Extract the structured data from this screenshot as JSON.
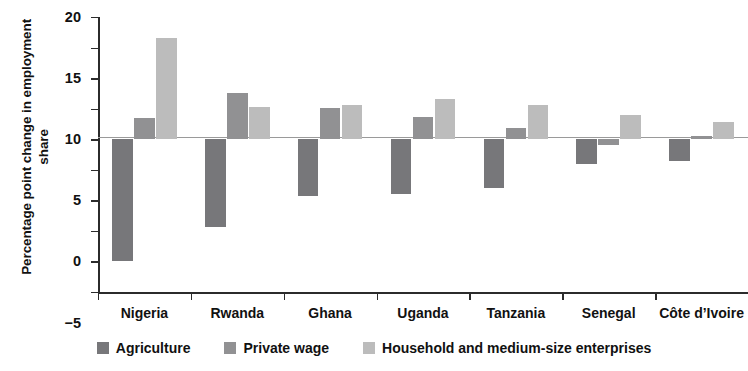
{
  "chart_data": {
    "type": "bar",
    "title": "",
    "subtitle": "",
    "xlabel": "",
    "ylabel": "Percentage point change in employment share",
    "ylim": [
      -25,
      20
    ],
    "ytick_labels": [
      "20",
      "15",
      "10",
      "5",
      "0",
      "−5",
      "−10",
      "−15",
      "−20",
      "−25"
    ],
    "ytick_values": [
      20,
      15,
      10,
      5,
      0,
      -5,
      -10,
      -15,
      -20,
      -25
    ],
    "grid": false,
    "legend_position": "bottom",
    "categories": [
      "Nigeria",
      "Rwanda",
      "Ghana",
      "Uganda",
      "Tanzania",
      "Senegal",
      "Côte d’Ivoire"
    ],
    "series": [
      {
        "name": "Agriculture",
        "color": "#77777a",
        "values": [
          -19.9,
          -14.3,
          -9.3,
          -9.0,
          -8.0,
          -4.1,
          -3.5
        ]
      },
      {
        "name": "Private wage",
        "color": "#919193",
        "values": [
          3.4,
          7.6,
          5.1,
          3.6,
          1.9,
          -1.0,
          0.5
        ]
      },
      {
        "name": "Household and medium-size enterprises",
        "color": "#bcbcbc",
        "values": [
          16.5,
          5.3,
          5.6,
          6.6,
          5.6,
          3.9,
          2.9
        ]
      }
    ]
  }
}
